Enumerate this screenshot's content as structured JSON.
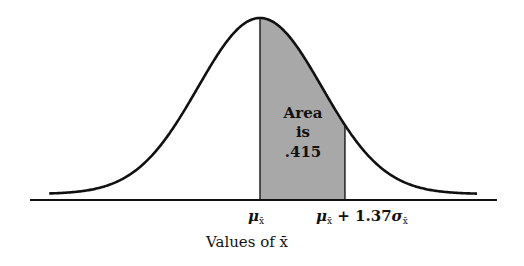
{
  "chart_data": {
    "type": "area",
    "title": "",
    "distribution": "normal",
    "mean_label": "μx̄",
    "shaded_region": {
      "from_sd": 0,
      "to_sd": 1.37,
      "area": 0.415
    },
    "annotation": [
      "Area",
      "is",
      ".415"
    ],
    "x_ticks": [
      {
        "sd": 0,
        "label": "μx̄"
      },
      {
        "sd": 1.37,
        "label": "μx̄ + 1.37σx̄"
      }
    ],
    "x_range_sd": [
      -3.4,
      3.5
    ],
    "xlabel": "Values of x̄",
    "ylabel": "",
    "grid": false,
    "legend": "none",
    "colors": {
      "curve": "#111111",
      "shade": "#a8a8a8",
      "axis": "#111111"
    }
  },
  "labels": {
    "area_line1": "Area",
    "area_line2": "is",
    "area_line3": ".415",
    "mu": "μ",
    "sub_xbar": "x̄",
    "plus": " + 1.37",
    "sigma": "σ",
    "xlabel": "Values of x̄"
  }
}
